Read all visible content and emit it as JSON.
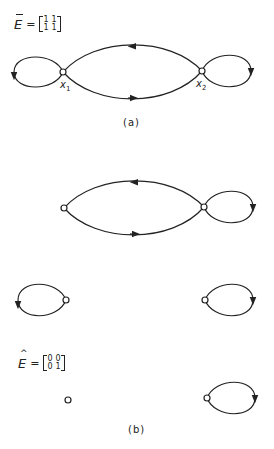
{
  "figure": {
    "part_a": {
      "caption": "(a)",
      "matrix": {
        "symbol": "E",
        "accent": "bar",
        "equals": "=",
        "rows": [
          [
            "1",
            "1"
          ],
          [
            "1",
            "1"
          ]
        ]
      },
      "nodes": [
        {
          "id": "x1",
          "label": "x",
          "subscript": "1"
        },
        {
          "id": "x2",
          "label": "x",
          "subscript": "2"
        }
      ],
      "edges": [
        {
          "from": "x1",
          "to": "x1",
          "type": "self-loop"
        },
        {
          "from": "x2",
          "to": "x1",
          "type": "arc-top"
        },
        {
          "from": "x1",
          "to": "x2",
          "type": "arc-bottom"
        },
        {
          "from": "x2",
          "to": "x2",
          "type": "self-loop"
        }
      ]
    },
    "part_b": {
      "caption": "(b)",
      "matrix": {
        "symbol": "E",
        "accent": "hat",
        "equals": "=",
        "rows": [
          [
            "0",
            "0"
          ],
          [
            "0",
            "1"
          ]
        ]
      },
      "subgraphs": [
        {
          "description": "two nodes with arcs both ways and self-loop on right node"
        },
        {
          "description": "two separate self-loops"
        },
        {
          "description": "isolated node and single self-loop on right node"
        }
      ]
    },
    "colors": {
      "stroke": "#222222",
      "background": "#ffffff"
    }
  }
}
